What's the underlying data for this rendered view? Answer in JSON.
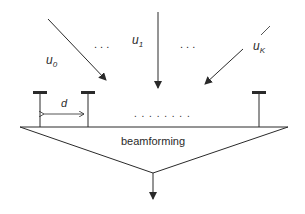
{
  "diagram": {
    "signals": [
      {
        "name": "u",
        "subscript": "0"
      },
      {
        "name": "u",
        "subscript": "1"
      },
      {
        "name": "u",
        "subscript": "K"
      }
    ],
    "ellipsis_top": ". . .",
    "ellipsis_array": ". . . . . . . .",
    "spacing_label": "d",
    "block_label": "beamforming",
    "colors": {
      "stroke": "#2a2a2a",
      "background": "#ffffff"
    }
  }
}
